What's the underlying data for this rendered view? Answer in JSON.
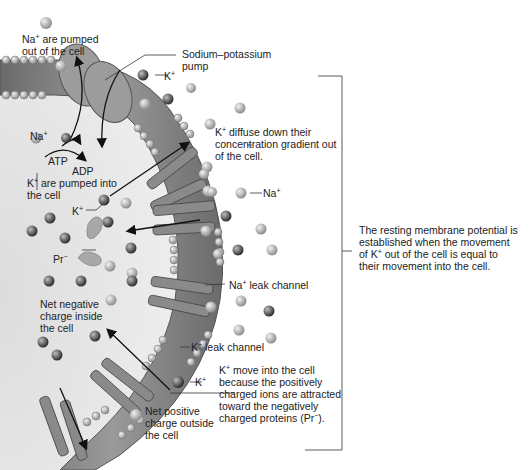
{
  "labels": {
    "na_pumped_out": [
      "Na",
      "+",
      " are pumped",
      "out of the cell"
    ],
    "pump": [
      "Sodium–potassium",
      "pump"
    ],
    "k_top": [
      "K",
      "+"
    ],
    "na_inside": [
      "Na",
      "+"
    ],
    "atp": "ATP",
    "adp": "ADP",
    "k_pumped_in": [
      "K",
      "+",
      " are pumped into",
      "the cell"
    ],
    "k_inside": [
      "K",
      "+"
    ],
    "pr": [
      "Pr",
      "−"
    ],
    "k_diffuse": [
      "K",
      "+",
      " diffuse down their",
      "concentration gradient out",
      "of the cell."
    ],
    "na_outside": [
      "Na",
      "+"
    ],
    "na_leak": [
      "Na",
      "+",
      " leak channel"
    ],
    "k_leak": [
      "K",
      "+",
      " leak channel"
    ],
    "net_negative": [
      "Net negative",
      "charge inside",
      "the cell"
    ],
    "k_bottom": [
      "K",
      "+"
    ],
    "k_move": [
      "K",
      "+",
      " move into the cell",
      "because the positively",
      "charged ions are attracted",
      "toward the negatively",
      "charged proteins (Pr",
      "−",
      ")."
    ],
    "net_positive": [
      "Net positive",
      "charge outside",
      "the cell"
    ],
    "resting": [
      "The resting membrane potential is",
      "established when the movement",
      "of K",
      "+",
      " out of the cell is equal to",
      "their movement into the cell."
    ]
  },
  "colors": {
    "membrane": "#7a7a7a",
    "membrane_dark": "#555555",
    "cytoplasm": "#e6e6e6",
    "ion_na": "#b0b0b0",
    "ion_k": "#5a5a5a",
    "protein": "#9a9a9a",
    "line": "#333333"
  }
}
